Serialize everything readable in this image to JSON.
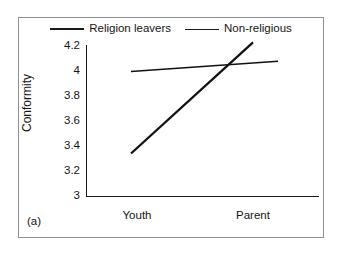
{
  "figure": {
    "panel_label": "(a)",
    "border_color": "#8e9095",
    "background_color": "#ffffff"
  },
  "legend": {
    "position": "top-center",
    "entries": [
      {
        "label": "Religion leavers",
        "color": "#111111",
        "swatch": "line-swatch-icon"
      },
      {
        "label": "Non-religious",
        "color": "#111111",
        "swatch": "line-swatch-icon"
      }
    ]
  },
  "chart_data": {
    "type": "line",
    "title": "",
    "subtitle": "",
    "xlabel": "",
    "ylabel": "Conformity",
    "categories": [
      "Youth",
      "Parent"
    ],
    "series": [
      {
        "name": "Religion leavers",
        "values": [
          3.34,
          4.22
        ],
        "color": "#111111",
        "width": "thick"
      },
      {
        "name": "Non-religious",
        "values": [
          3.99,
          4.07
        ],
        "color": "#111111",
        "width": "thin"
      }
    ],
    "ylim": [
      3,
      4.2
    ],
    "yticks": [
      "3",
      "3.2",
      "3.4",
      "3.6",
      "3.8",
      "4",
      "4.2"
    ],
    "ytick_values": [
      3,
      3.2,
      3.4,
      3.6,
      3.8,
      4,
      4.2
    ],
    "xtick_labels": [
      "Youth",
      "Parent"
    ],
    "grid": false,
    "legend_position": "top-center",
    "annotations": [
      "(a)"
    ]
  }
}
